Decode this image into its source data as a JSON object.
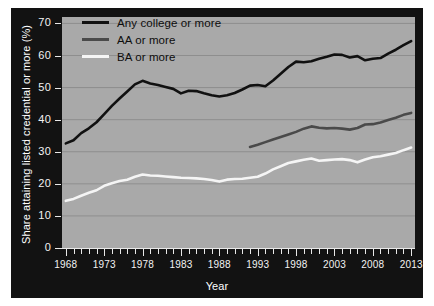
{
  "chart_data": {
    "type": "line",
    "title": "",
    "xlabel": "Year",
    "ylabel": "Share attaining listed credential or more (%)",
    "xlim": [
      1967.5,
      2013.5
    ],
    "ylim": [
      0,
      72
    ],
    "yticks": [
      0,
      10,
      20,
      30,
      40,
      50,
      60,
      70
    ],
    "xticks_labeled": [
      1968,
      1973,
      1978,
      1983,
      1988,
      1993,
      1998,
      2003,
      2008,
      2013
    ],
    "xtick_interval": 1,
    "grid": "horizontal",
    "legend_position": "top-left",
    "plot_background": "#a9a9a9",
    "figure_background": "#121212",
    "x": [
      1968,
      1969,
      1970,
      1971,
      1972,
      1973,
      1974,
      1975,
      1976,
      1977,
      1978,
      1979,
      1980,
      1981,
      1982,
      1983,
      1984,
      1985,
      1986,
      1987,
      1988,
      1989,
      1990,
      1991,
      1992,
      1993,
      1994,
      1995,
      1996,
      1997,
      1998,
      1999,
      2000,
      2001,
      2002,
      2003,
      2004,
      2005,
      2006,
      2007,
      2008,
      2009,
      2010,
      2011,
      2012,
      2013
    ],
    "series": [
      {
        "name": "Any college or more",
        "color": "#111111",
        "values": [
          32.6,
          33.6,
          35.8,
          37.3,
          39.2,
          41.7,
          44.3,
          46.6,
          48.8,
          51.0,
          52.1,
          51.3,
          50.8,
          50.2,
          49.6,
          48.2,
          49.0,
          48.9,
          48.2,
          47.6,
          47.2,
          47.6,
          48.3,
          49.4,
          50.6,
          50.8,
          50.4,
          52.2,
          54.3,
          56.4,
          58.1,
          57.9,
          58.2,
          59.0,
          59.6,
          60.3,
          60.2,
          59.4,
          59.8,
          58.5,
          59.0,
          59.2,
          60.6,
          61.8,
          63.2,
          64.5
        ]
      },
      {
        "name": "AA or more",
        "color": "#4a4a4a",
        "start_year": 1992,
        "values": [
          null,
          null,
          null,
          null,
          null,
          null,
          null,
          null,
          null,
          null,
          null,
          null,
          null,
          null,
          null,
          null,
          null,
          null,
          null,
          null,
          null,
          null,
          null,
          null,
          31.5,
          32.2,
          33.0,
          33.8,
          34.6,
          35.4,
          36.2,
          37.2,
          37.9,
          37.5,
          37.3,
          37.4,
          37.2,
          36.9,
          37.4,
          38.5,
          38.6,
          39.1,
          39.9,
          40.6,
          41.5,
          42.1
        ]
      },
      {
        "name": "BA or more",
        "color": "#f5f5f5",
        "values": [
          14.7,
          15.3,
          16.3,
          17.2,
          18.0,
          19.4,
          20.2,
          20.9,
          21.3,
          22.2,
          22.9,
          22.6,
          22.5,
          22.3,
          22.1,
          21.9,
          21.8,
          21.7,
          21.5,
          21.2,
          20.7,
          21.3,
          21.5,
          21.6,
          21.9,
          22.2,
          23.2,
          24.5,
          25.5,
          26.5,
          27.0,
          27.5,
          27.9,
          27.2,
          27.4,
          27.6,
          27.7,
          27.4,
          26.7,
          27.6,
          28.3,
          28.6,
          29.1,
          29.6,
          30.5,
          31.3
        ]
      }
    ]
  },
  "legend": {
    "items": [
      {
        "label": "Any college or more",
        "color": "#111111"
      },
      {
        "label": "AA or more",
        "color": "#4a4a4a"
      },
      {
        "label": "BA or more",
        "color": "#f5f5f5"
      }
    ]
  },
  "axes": {
    "y_title": "Share attaining listed credential or more (%)",
    "x_title": "Year",
    "y_labels": [
      "70",
      "60",
      "50",
      "40",
      "30",
      "20",
      "10",
      "0"
    ],
    "x_labels": [
      "1968",
      "1973",
      "1978",
      "1983",
      "1988",
      "1993",
      "1998",
      "2003",
      "2008",
      "2013"
    ]
  }
}
